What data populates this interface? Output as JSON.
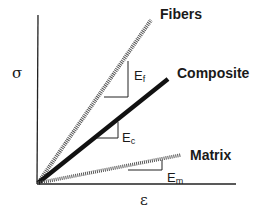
{
  "diagram": {
    "axes": {
      "y_label": "σ",
      "x_label": "ε"
    },
    "lines": [
      {
        "name": "Fibers",
        "label": "Fibers",
        "style": "hatched",
        "modulus_label": "E",
        "modulus_sub": "f"
      },
      {
        "name": "Composite",
        "label": "Composite",
        "style": "thick-solid",
        "modulus_label": "E",
        "modulus_sub": "c"
      },
      {
        "name": "Matrix",
        "label": "Matrix",
        "style": "hatched",
        "modulus_label": "E",
        "modulus_sub": "m"
      }
    ],
    "colors": {
      "line": "#111111",
      "background": "#ffffff"
    }
  }
}
